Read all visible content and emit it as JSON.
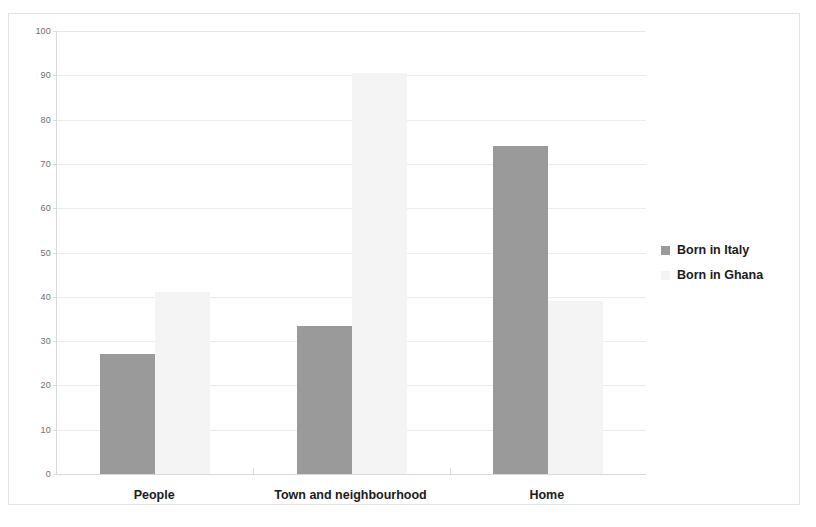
{
  "chart_data": {
    "type": "bar",
    "title": "",
    "subtitle": "",
    "xlabel": "",
    "ylabel": "",
    "categories": [
      "People",
      "Town and neighbourhood",
      "Home"
    ],
    "series": [
      {
        "name": "Born in Italy",
        "color": "#9a9a9a",
        "values": [
          27,
          33.5,
          74
        ]
      },
      {
        "name": "Born in Ghana",
        "color": "#f4f4f4",
        "values": [
          41,
          90.5,
          39
        ]
      }
    ],
    "ylim": [
      0,
      100
    ],
    "ytick_labels": [
      "0",
      "10",
      "20",
      "30",
      "40",
      "50",
      "60",
      "70",
      "80",
      "90",
      "100"
    ],
    "ytick_values": [
      0,
      10,
      20,
      30,
      40,
      50,
      60,
      70,
      80,
      90,
      100
    ],
    "grid": true,
    "grid_axis": "y",
    "legend_position": "right",
    "legend": [
      "Born in Italy",
      "Born in Ghana"
    ],
    "bar_group_mode": "grouped",
    "annotations": []
  },
  "colors": {
    "series_italy": "#9a9a9a",
    "series_ghana": "#f4f4f4",
    "gridline": "#ececec",
    "axis": "#d9d9d9",
    "figure_border": "#e3e3e3",
    "text": "#1b1b1b",
    "tick_text": "#6e6e6e"
  }
}
